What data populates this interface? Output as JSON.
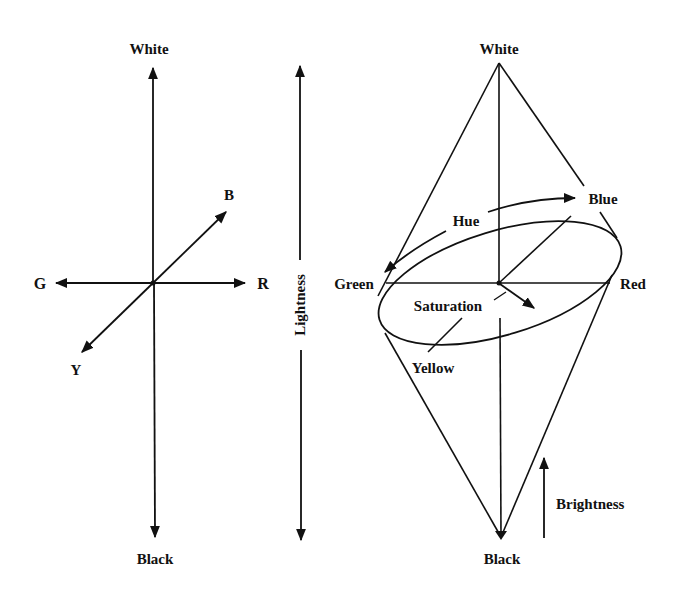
{
  "colors": {
    "background": "#ffffff",
    "ink": "#111111"
  },
  "left_diagram": {
    "title": "Opponent color axes",
    "top_label": "White",
    "bottom_label": "Black",
    "left_label": "G",
    "right_label": "R",
    "diag_up_label": "B",
    "diag_down_label": "Y"
  },
  "middle_axis": {
    "label": "Lightness"
  },
  "right_diagram": {
    "title": "Color double cone",
    "top_label": "White",
    "bottom_label": "Black",
    "hue_label": "Hue",
    "saturation_label": "Saturation",
    "brightness_label": "Brightness",
    "hues": {
      "green": "Green",
      "red": "Red",
      "blue": "Blue",
      "yellow": "Yellow"
    }
  }
}
